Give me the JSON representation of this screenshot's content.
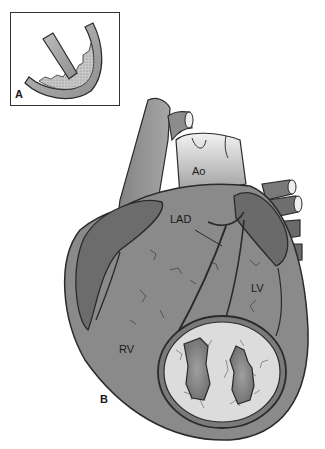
{
  "figure": {
    "panels": [
      {
        "id": "A",
        "label": "A",
        "description": "inset-cross-section-vessel"
      },
      {
        "id": "B",
        "label": "B",
        "description": "heart-anterior-view"
      }
    ],
    "anatomy_labels": {
      "aorta": "Ao",
      "lad": "LAD",
      "left_ventricle": "LV",
      "right_ventricle": "RV"
    },
    "colors": {
      "heart_fill": "#8a8a8a",
      "heart_dark": "#666666",
      "outline": "#2a2a2a",
      "infarct_fill": "#d8d8d8",
      "cavity_fill": "#7c7c7c",
      "aorta_light": "#e6e6e6"
    }
  }
}
